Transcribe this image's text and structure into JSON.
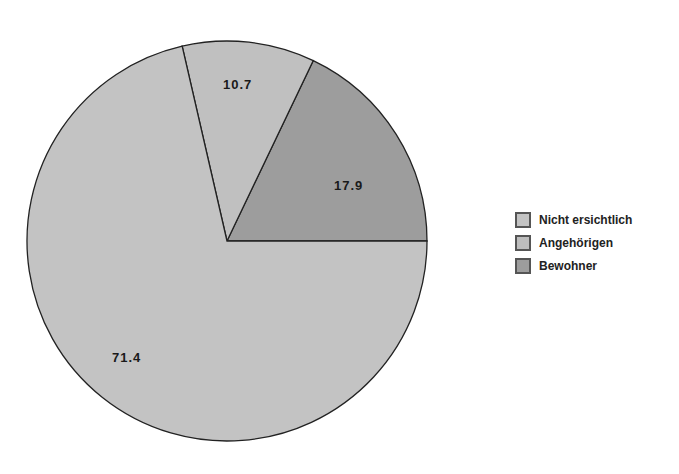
{
  "chart_data": {
    "type": "pie",
    "title": "",
    "slices": [
      {
        "label": "Nicht ersichtlich",
        "value": 71.4,
        "color": "#c3c3c3",
        "display": "71.4"
      },
      {
        "label": "Angehörigen",
        "value": 10.7,
        "color": "#c0c0c0",
        "display": "10.7"
      },
      {
        "label": "Bewohner",
        "value": 17.9,
        "color": "#9d9d9d",
        "display": "17.9"
      }
    ],
    "legend_position": "right",
    "unit": "%"
  },
  "legend": {
    "items": [
      {
        "label": "Nicht ersichtlich",
        "color": "#c3c3c3"
      },
      {
        "label": "Angehörigen",
        "color": "#bdbdbd"
      },
      {
        "label": "Bewohner",
        "color": "#9d9d9d"
      }
    ]
  }
}
